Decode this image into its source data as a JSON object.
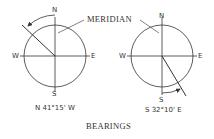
{
  "title": "BEARINGS",
  "callout": "MERIDIAN",
  "compasses": [
    {
      "id": "left",
      "labels": {
        "n": "N",
        "s": "S",
        "e": "E",
        "w": "W"
      },
      "bearing": "N 41°15' W",
      "reference": "N",
      "direction": "W",
      "angle_deg": 41.25
    },
    {
      "id": "right",
      "labels": {
        "n": "N",
        "s": "S",
        "e": "E",
        "w": "W"
      },
      "bearing": "S 32°10' E",
      "reference": "S",
      "direction": "E",
      "angle_deg": 32.1667
    }
  ],
  "colors": {
    "line": "#333333",
    "background": "#ffffff"
  }
}
